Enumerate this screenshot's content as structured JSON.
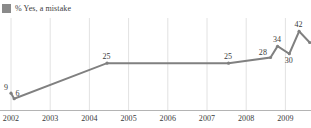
{
  "legend": {
    "marker_icon": "legend-square-icon",
    "label": "% Yes, a mistake",
    "color": "#8a8a8a"
  },
  "style": {
    "line_color": "#808080",
    "grid_color": "#e2e2e2",
    "axis_color": "#b4b4b4",
    "text_color": "#3a3a3a",
    "background": "#ffffff"
  },
  "chart_data": {
    "type": "line",
    "title": "",
    "subtitle": "",
    "xlabel": "",
    "ylabel": "",
    "grid": true,
    "legend_position": "top-left",
    "xlim": [
      2002,
      2009.8
    ],
    "ylim": [
      0,
      48
    ],
    "xticks": [
      "2002",
      "2003",
      "2004",
      "2005",
      "2006",
      "2007",
      "2008",
      "2009"
    ],
    "series": [
      {
        "name": "% Yes, a mistake",
        "color": "#808080",
        "points": [
          {
            "label": "9",
            "x": 2002.0,
            "y": 9,
            "label_pos": "left"
          },
          {
            "label": "6",
            "x": 2002.08,
            "y": 6,
            "label_pos": "above-right"
          },
          {
            "label": "25",
            "x": 2004.45,
            "y": 25,
            "label_pos": "above"
          },
          {
            "label": "25",
            "x": 2007.55,
            "y": 25,
            "label_pos": "above"
          },
          {
            "label": "28",
            "x": 2008.62,
            "y": 28,
            "label_pos": "left"
          },
          {
            "label": "34",
            "x": 2008.8,
            "y": 34,
            "label_pos": "above"
          },
          {
            "label": "30",
            "x": 2009.1,
            "y": 30,
            "label_pos": "below"
          },
          {
            "label": "42",
            "x": 2009.35,
            "y": 42,
            "label_pos": "above"
          },
          {
            "label": "36",
            "x": 2009.62,
            "y": 36,
            "label_pos": "right"
          }
        ]
      }
    ]
  }
}
